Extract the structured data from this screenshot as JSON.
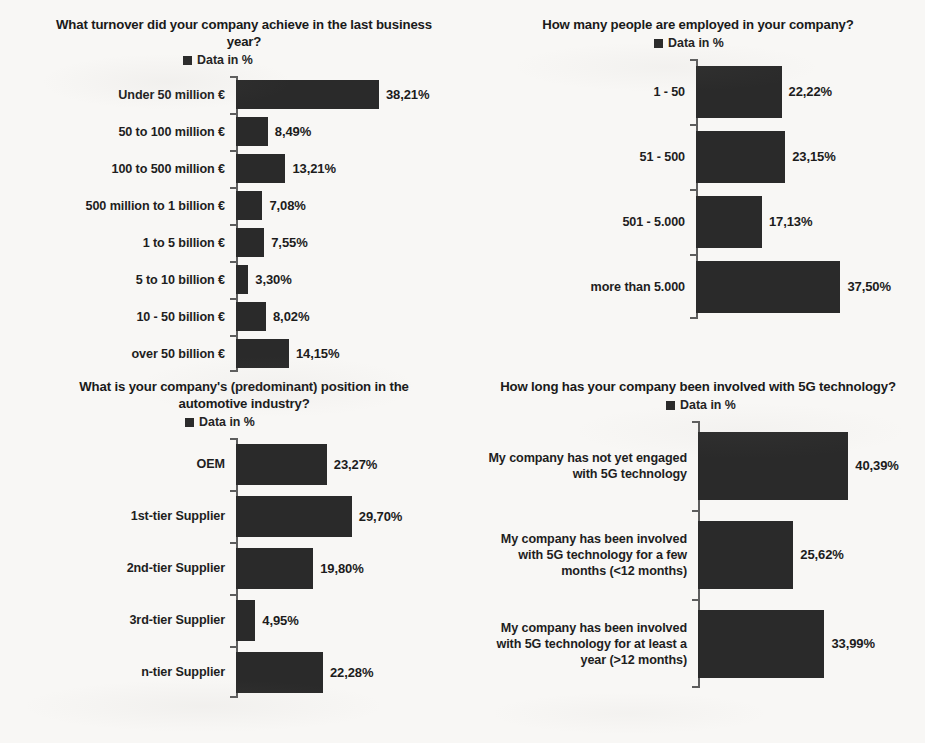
{
  "page": {
    "background_color": "#f8f7f5",
    "bar_color": "#2a2a2a",
    "axis_color": "#5d5d5d",
    "text_color": "#1e1e1e"
  },
  "legend_label": "Data in %",
  "charts": [
    {
      "id": "turnover",
      "title": "What turnover did your company achieve in the last business year?",
      "legend": "Data in %",
      "chart_data": {
        "type": "bar",
        "orientation": "horizontal",
        "title": "What turnover did your company achieve in the last business year?",
        "xlabel": "",
        "ylabel": "",
        "xlim": [
          0,
          40
        ],
        "grid": false,
        "legend_position": "top-center",
        "series_name": "Data in %",
        "categories": [
          "Under 50 million €",
          "50 to 100 million €",
          "100 to 500 million €",
          "500 million to 1 billion €",
          "1 to 5 billion €",
          "5 to 10 billion €",
          "10 - 50 billion €",
          "over  50 billion €"
        ],
        "values": [
          38.21,
          8.49,
          13.21,
          7.08,
          7.55,
          3.3,
          8.02,
          14.15
        ],
        "labels": [
          "38,21%",
          "8,49%",
          "13,21%",
          "7,08%",
          "7,55%",
          "3,30%",
          "8,02%",
          "14,15%"
        ]
      }
    },
    {
      "id": "employees",
      "title": "How many people are employed in your company?",
      "legend": "Data in %",
      "chart_data": {
        "type": "bar",
        "orientation": "horizontal",
        "title": "How many people are employed in your company?",
        "xlabel": "",
        "ylabel": "",
        "xlim": [
          0,
          40
        ],
        "grid": false,
        "legend_position": "top-center",
        "series_name": "Data in %",
        "categories": [
          "1 - 50",
          "51 - 500",
          "501 - 5.000",
          "more than 5.000"
        ],
        "values": [
          22.22,
          23.15,
          17.13,
          37.5
        ],
        "labels": [
          "22,22%",
          "23,15%",
          "17,13%",
          "37,50%"
        ]
      }
    },
    {
      "id": "position",
      "title": "What is your company's (predominant) position in the automotive industry?",
      "legend": "Data in %",
      "chart_data": {
        "type": "bar",
        "orientation": "horizontal",
        "title": "What is your company's (predominant) position in the automotive industry?",
        "xlabel": "",
        "ylabel": "",
        "xlim": [
          0,
          32
        ],
        "grid": false,
        "legend_position": "top-center",
        "series_name": "Data in %",
        "categories": [
          "OEM",
          "1st-tier Supplier",
          "2nd-tier Supplier",
          "3rd-tier Supplier",
          "n-tier Supplier"
        ],
        "values": [
          23.27,
          29.7,
          19.8,
          4.95,
          22.28
        ],
        "labels": [
          "23,27%",
          "29,70%",
          "19,80%",
          "4,95%",
          "22,28%"
        ]
      }
    },
    {
      "id": "fiveg",
      "title": "How long has your company been involved with 5G technology?",
      "legend": "Data in %",
      "chart_data": {
        "type": "bar",
        "orientation": "horizontal",
        "title": "How long has your company been involved with 5G technology?",
        "xlabel": "",
        "ylabel": "",
        "xlim": [
          0,
          42
        ],
        "grid": false,
        "legend_position": "top-center",
        "series_name": "Data in %",
        "categories": [
          "My company has not yet engaged with 5G technology",
          "My company has been involved with 5G technology for a few months (<12 months)",
          "My company has been involved with 5G technology for at least a year (>12 months)"
        ],
        "values": [
          40.39,
          25.62,
          33.99
        ],
        "labels": [
          "40,39%",
          "25,62%",
          "33,99%"
        ]
      }
    }
  ]
}
